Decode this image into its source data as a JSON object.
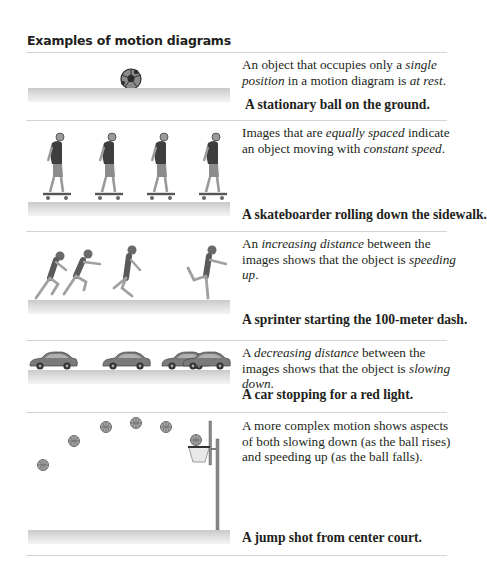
{
  "page": {
    "title": "Examples of motion diagrams"
  },
  "examples": [
    {
      "figure": "stationary-soccer-ball",
      "description": {
        "parts": [
          "An object that occupies only a ",
          "single position",
          " in a motion diagram is ",
          "at rest",
          "."
        ]
      },
      "caption": "A stationary ball on the ground."
    },
    {
      "figure": "skateboarder-sequence",
      "description": {
        "parts": [
          "Images that are ",
          "equally spaced",
          " indicate an object moving with ",
          "constant speed",
          "."
        ]
      },
      "caption": "A skateboarder rolling down the sidewalk."
    },
    {
      "figure": "sprinter-sequence",
      "description": {
        "parts": [
          "An ",
          "increasing distance",
          " between the images shows that the object is ",
          "speeding up",
          "."
        ]
      },
      "caption": "A sprinter starting the 100-meter dash."
    },
    {
      "figure": "car-sequence",
      "description": {
        "parts": [
          "A ",
          "decreasing distance",
          " between the images shows that the object is ",
          "slowing down",
          "."
        ]
      },
      "caption": "A car stopping for a red light."
    },
    {
      "figure": "basketball-trajectory",
      "description": {
        "parts": [
          "A more complex motion shows aspects of both slowing down (as the ball rises) and speeding up (as the ball falls)."
        ]
      },
      "caption": "A jump shot from center court."
    }
  ],
  "colors": {
    "text": "#231f20",
    "rule": "#d4d4d4",
    "ground": "#d0d0d0",
    "figure_gray": "#6b6b6b",
    "shirt": "#3e3e3e"
  }
}
